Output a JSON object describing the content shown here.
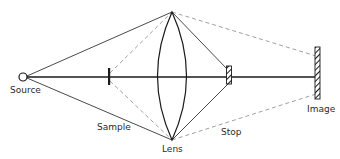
{
  "diagram": {
    "type": "optical-ray-diagram",
    "labels": {
      "source": "Source",
      "sample": "Sample",
      "lens": "Lens",
      "stop": "Stop",
      "image": "Image"
    },
    "colors": {
      "line": "#1a1a1a",
      "dashed": "#888888",
      "background": "#ffffff"
    },
    "components": [
      {
        "name": "Source",
        "shape": "open-circle"
      },
      {
        "name": "Sample",
        "shape": "vertical-bar"
      },
      {
        "name": "Lens",
        "shape": "biconvex-lens"
      },
      {
        "name": "Stop",
        "shape": "hatched-aperture"
      },
      {
        "name": "Image",
        "shape": "hatched-screen"
      }
    ],
    "rays": {
      "solid": "illumination rays from source through lens to stop",
      "dashed": "imaging rays from sample through lens to image"
    }
  }
}
